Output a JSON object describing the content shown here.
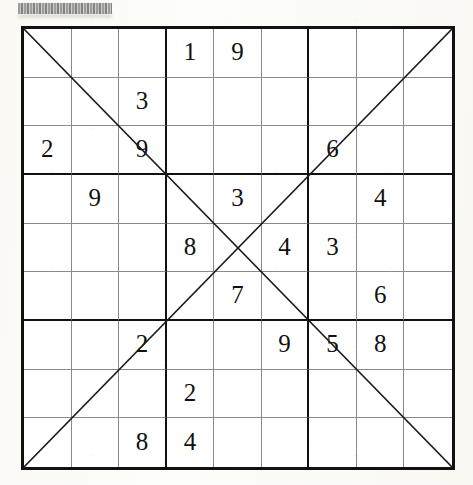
{
  "document": {
    "type": "diagonal-sudoku-puzzle",
    "redacted_header_label": "",
    "grid_size": 9,
    "box_size": 3
  },
  "puzzle": {
    "title": "Diagonal Sudoku Grid",
    "diagonals_drawn": [
      "main",
      "anti"
    ],
    "rows": [
      [
        "",
        "",
        "",
        "1",
        "9",
        "",
        "",
        "",
        ""
      ],
      [
        "",
        "",
        "3",
        "",
        "",
        "",
        "",
        "",
        ""
      ],
      [
        "2",
        "",
        "9",
        "",
        "",
        "",
        "6",
        "",
        ""
      ],
      [
        "",
        "9",
        "",
        "",
        "3",
        "",
        "",
        "4",
        ""
      ],
      [
        "",
        "",
        "",
        "8",
        "",
        "4",
        "3",
        "",
        ""
      ],
      [
        "",
        "",
        "",
        "",
        "7",
        "",
        "",
        "6",
        ""
      ],
      [
        "",
        "",
        "2",
        "",
        "",
        "9",
        "5",
        "8",
        ""
      ],
      [
        "",
        "",
        "",
        "2",
        "",
        "",
        "",
        "",
        ""
      ],
      [
        "",
        "",
        "8",
        "4",
        "",
        "",
        "",
        "",
        ""
      ]
    ],
    "clue_count": 20,
    "clues": [
      {
        "row": 1,
        "col": 4,
        "value": "1"
      },
      {
        "row": 1,
        "col": 5,
        "value": "9"
      },
      {
        "row": 2,
        "col": 3,
        "value": "3"
      },
      {
        "row": 3,
        "col": 1,
        "value": "2"
      },
      {
        "row": 3,
        "col": 3,
        "value": "9"
      },
      {
        "row": 3,
        "col": 7,
        "value": "6"
      },
      {
        "row": 4,
        "col": 2,
        "value": "9"
      },
      {
        "row": 4,
        "col": 5,
        "value": "3"
      },
      {
        "row": 4,
        "col": 8,
        "value": "4"
      },
      {
        "row": 5,
        "col": 4,
        "value": "8"
      },
      {
        "row": 5,
        "col": 6,
        "value": "4"
      },
      {
        "row": 5,
        "col": 7,
        "value": "3"
      },
      {
        "row": 6,
        "col": 5,
        "value": "7"
      },
      {
        "row": 6,
        "col": 8,
        "value": "6"
      },
      {
        "row": 7,
        "col": 3,
        "value": "2"
      },
      {
        "row": 7,
        "col": 6,
        "value": "9"
      },
      {
        "row": 7,
        "col": 7,
        "value": "5"
      },
      {
        "row": 7,
        "col": 8,
        "value": "8"
      },
      {
        "row": 8,
        "col": 4,
        "value": "2"
      },
      {
        "row": 9,
        "col": 3,
        "value": "8"
      },
      {
        "row": 9,
        "col": 4,
        "value": "4"
      }
    ]
  },
  "colors": {
    "page_background": "#fdfdfb",
    "grid_background": "#ffffff",
    "thick_line": "#111111",
    "thin_line": "#8a8a8a",
    "digit": "#111111",
    "redaction": "#8d8d8d"
  }
}
